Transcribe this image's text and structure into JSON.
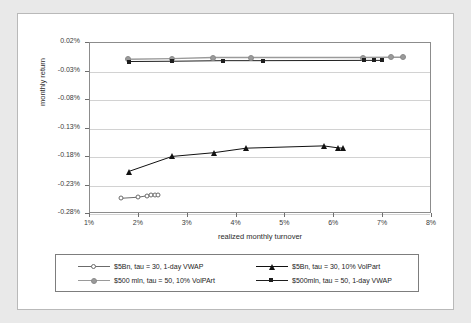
{
  "chart_data": {
    "type": "scatter",
    "title": "",
    "xlabel": "realized monthly turnover",
    "ylabel": "monthly return",
    "xlim": [
      1,
      8
    ],
    "ylim": [
      -0.28,
      0.02
    ],
    "x_ticks": [
      "1%",
      "2%",
      "3%",
      "4%",
      "5%",
      "6%",
      "7%",
      "8%"
    ],
    "x_tick_values": [
      1,
      2,
      3,
      4,
      5,
      6,
      7,
      8
    ],
    "y_ticks": [
      "0.02%",
      "-0.03%",
      "-0.08%",
      "-0.13%",
      "-0.18%",
      "-0.23%",
      "-0.28%"
    ],
    "y_tick_values": [
      0.02,
      -0.03,
      -0.08,
      -0.13,
      -0.18,
      -0.23,
      -0.28
    ],
    "grid": true,
    "legend_position": "bottom",
    "series": [
      {
        "name": "$5Bn, tau = 30, 1-day VWAP",
        "marker": "circle-open",
        "color": "#6b6b6b",
        "points": [
          {
            "x": 1.63,
            "y": -0.2525
          },
          {
            "x": 1.99,
            "y": -0.2505
          },
          {
            "x": 2.17,
            "y": -0.248
          },
          {
            "x": 2.25,
            "y": -0.2472
          },
          {
            "x": 2.33,
            "y": -0.2468
          },
          {
            "x": 2.4,
            "y": -0.2465
          }
        ]
      },
      {
        "name": "$5Bn, tau = 30, 10% VolPart",
        "marker": "triangle",
        "color": "#111111",
        "points": [
          {
            "x": 1.79,
            "y": -0.2055
          },
          {
            "x": 2.68,
            "y": -0.179
          },
          {
            "x": 3.53,
            "y": -0.1725
          },
          {
            "x": 4.2,
            "y": -0.1645
          },
          {
            "x": 5.78,
            "y": -0.1605
          },
          {
            "x": 6.08,
            "y": -0.164
          },
          {
            "x": 6.18,
            "y": -0.1645
          }
        ]
      },
      {
        "name": "$500 mln, tau = 50, 10% VolPArt",
        "marker": "circle-gray",
        "color": "#9a9a9a",
        "points": [
          {
            "x": 1.78,
            "y": -0.0085
          },
          {
            "x": 2.67,
            "y": -0.0075
          },
          {
            "x": 3.52,
            "y": -0.0055
          },
          {
            "x": 4.3,
            "y": -0.0055
          },
          {
            "x": 6.58,
            "y": -0.0055
          },
          {
            "x": 7.16,
            "y": -0.005
          },
          {
            "x": 7.4,
            "y": -0.005
          }
        ]
      },
      {
        "name": "$500mln, tau = 50, 1-day VWAP",
        "marker": "square-dark",
        "color": "#1e1e1e",
        "points": [
          {
            "x": 1.79,
            "y": -0.0125
          },
          {
            "x": 2.68,
            "y": -0.012
          },
          {
            "x": 3.72,
            "y": -0.011
          },
          {
            "x": 4.55,
            "y": -0.011
          },
          {
            "x": 6.6,
            "y": -0.0105
          },
          {
            "x": 6.82,
            "y": -0.0105
          },
          {
            "x": 6.98,
            "y": -0.0105
          }
        ]
      }
    ]
  },
  "legend": {
    "entries": [
      {
        "label": "$5Bn, tau = 30, 1-day VWAP",
        "marker": "circle-open"
      },
      {
        "label": "$5Bn, tau = 30, 10% VolPart",
        "marker": "triangle"
      },
      {
        "label": "$500 mln, tau = 50, 10% VolPArt",
        "marker": "circle-gray"
      },
      {
        "label": "$500mln, tau = 50, 1-day VWAP",
        "marker": "square-dark"
      }
    ]
  },
  "colors": {
    "panel_background": "#ffffff",
    "figure_background": "#e9e9e9",
    "axis": "#8c8c8c",
    "gridline": "#d2d2d2",
    "text": "#2b2b2b"
  }
}
